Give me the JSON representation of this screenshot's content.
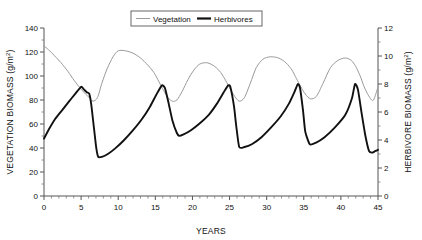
{
  "chart_data": {
    "type": "line",
    "title": "",
    "xlabel": "YEARS",
    "ylabel": "VEGETATION BIOMASS (g/m2)",
    "ylabel_right": "HERBIVORE BIOMASS (g/m2)",
    "xlim": [
      0,
      45
    ],
    "ylim": [
      0,
      140
    ],
    "ylim_right": [
      0,
      12
    ],
    "xticks": [
      0,
      5,
      10,
      15,
      20,
      25,
      30,
      35,
      40,
      45
    ],
    "xtick_labels": [
      "0",
      "5",
      "10",
      "15",
      "20",
      "25",
      "30",
      "35",
      "40",
      "45"
    ],
    "xtick_minor_step": 1,
    "yticks": [
      0,
      20,
      40,
      60,
      80,
      100,
      120,
      140
    ],
    "ytick_labels": [
      "0",
      "20",
      "40",
      "60",
      "80",
      "100",
      "120",
      "140"
    ],
    "yticks_right": [
      0,
      2,
      4,
      6,
      8,
      10,
      12
    ],
    "ytick_labels_right": [
      "0",
      "2",
      "4",
      "6",
      "8",
      "10",
      "12"
    ],
    "grid": false,
    "legend_position": "top-center",
    "series": [
      {
        "name": "Vegetation",
        "axis": "left",
        "color": "#9a9a9a",
        "width": 1,
        "x": [
          0,
          0.6,
          1.4,
          2.3,
          3.2,
          4.1,
          5.0,
          5.6,
          6.1,
          6.6,
          7.2,
          7.8,
          8.5,
          9.3,
          10.0,
          11.0,
          12.0,
          13.0,
          14.0,
          14.8,
          15.5,
          16.1,
          16.7,
          17.3,
          17.9,
          18.6,
          19.4,
          20.2,
          21.0,
          22.0,
          23.0,
          23.8,
          24.5,
          25.1,
          25.7,
          26.3,
          27.0,
          27.8,
          28.6,
          29.5,
          30.5,
          31.6,
          32.6,
          33.4,
          34.0,
          34.6,
          35.2,
          35.9,
          36.7,
          37.6,
          38.6,
          39.6,
          40.6,
          41.4,
          42.0,
          42.6,
          43.2,
          43.9,
          44.4,
          45.0
        ],
        "y": [
          125,
          122,
          117,
          111,
          104,
          96,
          89,
          85,
          82,
          79,
          82,
          94,
          106,
          116,
          121,
          121,
          119,
          115,
          109,
          103,
          95,
          88,
          82,
          79,
          80,
          87,
          97,
          105,
          110,
          111,
          108,
          103,
          96,
          89,
          83,
          79,
          82,
          94,
          107,
          114,
          116,
          115,
          111,
          105,
          98,
          91,
          85,
          81,
          83,
          94,
          107,
          113,
          115,
          113,
          108,
          100,
          90,
          82,
          80,
          91
        ]
      },
      {
        "name": "Herbivores",
        "axis": "right",
        "color": "#111111",
        "width": 1.9,
        "x": [
          0,
          0.7,
          1.5,
          2.4,
          3.3,
          4.2,
          5.0,
          5.4,
          5.8,
          6.1,
          6.4,
          7.0,
          7.3,
          7.8,
          8.6,
          9.6,
          10.8,
          12.0,
          13.2,
          14.3,
          15.2,
          15.9,
          16.3,
          16.8,
          17.3,
          17.9,
          18.2,
          18.8,
          19.8,
          21.0,
          22.2,
          23.3,
          24.2,
          24.8,
          25.1,
          25.6,
          25.9,
          26.3,
          27.0,
          28.0,
          29.3,
          30.6,
          31.9,
          33.0,
          33.8,
          34.2,
          34.5,
          34.9,
          35.2,
          35.8,
          36.6,
          37.8,
          39.2,
          40.6,
          41.5,
          41.9,
          42.3,
          42.8,
          43.3,
          43.8,
          44.2,
          44.6,
          45.0
        ],
        "y": [
          4.1,
          4.8,
          5.5,
          6.1,
          6.7,
          7.3,
          7.8,
          7.6,
          7.4,
          7.3,
          6.4,
          3.6,
          2.8,
          2.8,
          3.0,
          3.4,
          4.0,
          4.7,
          5.5,
          6.4,
          7.3,
          7.9,
          7.7,
          6.6,
          5.4,
          4.5,
          4.3,
          4.4,
          4.7,
          5.2,
          5.8,
          6.6,
          7.4,
          7.9,
          7.8,
          6.4,
          5.0,
          3.5,
          3.5,
          3.7,
          4.2,
          4.9,
          5.7,
          6.6,
          7.5,
          8.0,
          7.7,
          6.1,
          4.6,
          3.7,
          3.8,
          4.2,
          4.9,
          5.8,
          7.0,
          8.0,
          7.6,
          5.9,
          4.3,
          3.2,
          3.1,
          3.2,
          3.3
        ]
      }
    ]
  },
  "legend": {
    "items": [
      {
        "label": "Vegetation",
        "style": "thin-gray-line"
      },
      {
        "label": "Herbivores",
        "style": "thick-black-line"
      }
    ]
  },
  "colors": {
    "vegetation": "#9a9a9a",
    "herbivores": "#111111",
    "axis": "#555555",
    "background": "#ffffff"
  }
}
